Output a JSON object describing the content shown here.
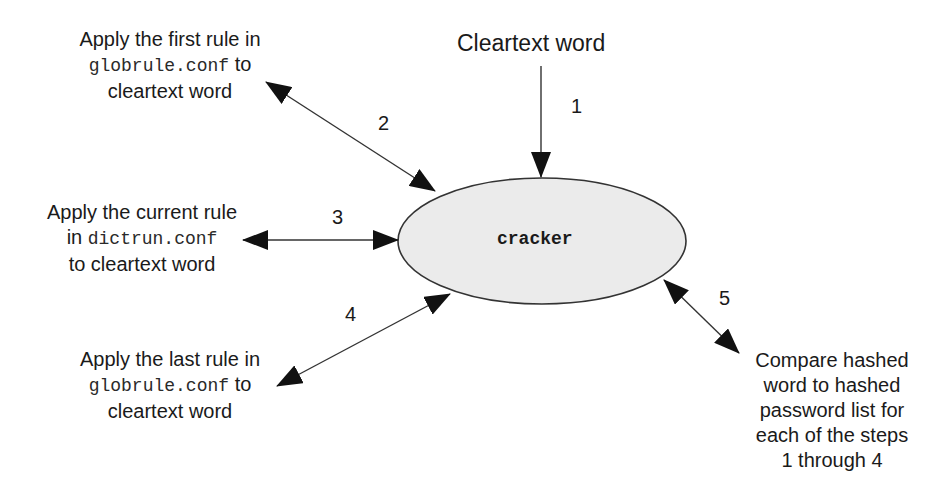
{
  "diagram": {
    "type": "flow",
    "center_node": {
      "label": "cracker",
      "fill": "#ebebeb",
      "stroke": "#333333"
    },
    "input": {
      "label": "Cleartext word"
    },
    "steps": [
      {
        "number": "1",
        "direction": "into cracker",
        "source": "Cleartext word"
      },
      {
        "number": "2",
        "direction": "bidirectional",
        "label_line1": "Apply the first rule in",
        "label_code": "globrule.conf",
        "label_after_code": " to",
        "label_line3": "cleartext word"
      },
      {
        "number": "3",
        "direction": "bidirectional",
        "label_line1": "Apply the current rule",
        "label_before_code": "in ",
        "label_code": "dictrun.conf",
        "label_line3": "to cleartext word"
      },
      {
        "number": "4",
        "direction": "bidirectional",
        "label_line1": "Apply the last rule in",
        "label_code": "globrule.conf",
        "label_after_code": " to",
        "label_line3": "cleartext word"
      },
      {
        "number": "5",
        "direction": "bidirectional",
        "label_lines": [
          "Compare hashed",
          "word to hashed",
          "password list for",
          "each of the steps",
          "1 through 4"
        ]
      }
    ],
    "colors": {
      "line": "#333333",
      "arrowhead": "#111111",
      "text": "#1a1a1a"
    }
  }
}
